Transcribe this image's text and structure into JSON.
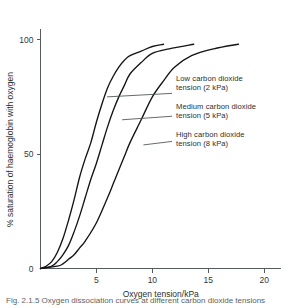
{
  "chart_data": {
    "type": "line",
    "title": "",
    "xlabel": "Oxygen tension/kPa",
    "ylabel": "% saturation of haemoglobin with oxygen",
    "xlim": [
      0,
      21.5
    ],
    "ylim": [
      0,
      104
    ],
    "xticks": [
      5,
      10,
      15,
      20
    ],
    "xtick_labels": [
      "5",
      "10",
      "15",
      "20"
    ],
    "yticks": [
      0,
      50,
      100
    ],
    "ytick_labels": [
      "0",
      "50",
      "100"
    ],
    "origin_label": "0",
    "grid": false,
    "legend_position": "inline-annotations",
    "series": [
      {
        "name": "Low carbon dioxide tension (2 kPa)",
        "p50": 4.3,
        "hill_n": 2.8,
        "x_end": 11.0,
        "y_max": 98,
        "x": [
          0.0,
          0.5,
          1.0,
          1.5,
          2.0,
          2.5,
          3.0,
          3.5,
          4.0,
          4.5,
          5.0,
          5.5,
          6.0,
          6.5,
          7.0,
          7.5,
          8.0,
          9.0,
          10.0,
          11.0
        ],
        "y": [
          0,
          1,
          3,
          7,
          13,
          21,
          30,
          40,
          48,
          55,
          64,
          72,
          79,
          84,
          88,
          91,
          93,
          95,
          97,
          98
        ]
      },
      {
        "name": "Medium carbon dioxide tension (5 kPa)",
        "p50": 5.8,
        "hill_n": 2.8,
        "x_end": 13.7,
        "y_max": 98,
        "x": [
          0.0,
          1.0,
          1.5,
          2.0,
          2.5,
          3.0,
          3.5,
          4.0,
          4.5,
          5.0,
          5.5,
          6.0,
          6.5,
          7.0,
          7.5,
          8.0,
          9.0,
          10.0,
          11.5,
          13.7
        ],
        "y": [
          0,
          1,
          3,
          6,
          10,
          16,
          23,
          31,
          39,
          46,
          54,
          62,
          69,
          75,
          80,
          85,
          90,
          94,
          96,
          98
        ]
      },
      {
        "name": "High carbon dioxide tension (8 kPa)",
        "p50": 7.9,
        "hill_n": 2.9,
        "x_end": 17.7,
        "y_max": 98,
        "x": [
          0.0,
          1.5,
          2.0,
          2.5,
          3.0,
          3.5,
          4.0,
          5.0,
          6.0,
          6.5,
          7.0,
          7.5,
          8.0,
          9.0,
          10.0,
          11.0,
          12.0,
          13.5,
          15.5,
          17.7
        ],
        "y": [
          0,
          1,
          2,
          4,
          6,
          9,
          12,
          20,
          31,
          37,
          43,
          49,
          55,
          65,
          75,
          82,
          88,
          93,
          96,
          98
        ]
      }
    ],
    "annotations": [
      {
        "id": "low",
        "line1": "Low carbon dioxide",
        "line2": "tension (2 kPa)",
        "anchor_x": 5.95,
        "anchor_y": 75
      },
      {
        "id": "medium",
        "line1": "Medium carbon dioxide",
        "line2": "tension (5 kPa)",
        "anchor_x": 7.3,
        "anchor_y": 65
      },
      {
        "id": "high",
        "line1": "High carbon dioxide",
        "line2": "tension (8 kPa)",
        "anchor_x": 9.2,
        "anchor_y": 54
      }
    ]
  },
  "caption": "Fig. 2.1.5 Oxygen dissociation curves at different carbon dioxide tensions",
  "colors": {
    "curve": "#141414",
    "axis": "#555a5e",
    "text": "#2b2f31",
    "background": "#ffffff"
  }
}
